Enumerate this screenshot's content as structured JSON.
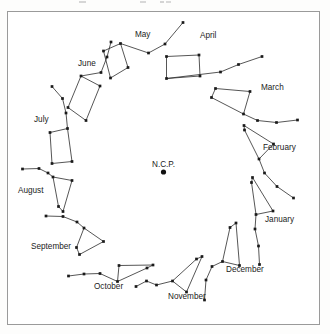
{
  "figure": {
    "pole_label": "N.C.P.",
    "pole_point": {
      "x": 163.5,
      "y": 172.0
    },
    "frame": {
      "x": 7,
      "y": 11,
      "width": 313,
      "height": 314,
      "border_color": "#9a9a9a"
    },
    "colors": {
      "star": "#1a1a1a",
      "line": "#2b2b2b",
      "text": "#1b1b1b",
      "background": "#ffffff"
    }
  },
  "chart_data": {
    "type": "scatter",
    "title": "",
    "xlabel": "",
    "ylabel": "",
    "grid": false,
    "legend": "none",
    "center": {
      "label": "N.C.P.",
      "x": 163.5,
      "y": 172.0
    },
    "xlim": [
      7,
      320
    ],
    "ylim": [
      11,
      325
    ],
    "series": [
      {
        "name": "May",
        "label": "May",
        "label_pos": {
          "x": 135,
          "y": 37
        },
        "points": [
          {
            "x": 103.5,
            "y": 51.0
          },
          {
            "x": 110.5,
            "y": 78.0
          },
          {
            "x": 128.0,
            "y": 67.5
          },
          {
            "x": 120.5,
            "y": 43.5
          },
          {
            "x": 148.5,
            "y": 53.0
          },
          {
            "x": 165.0,
            "y": 44.0
          },
          {
            "x": 183.0,
            "y": 22.5
          }
        ],
        "bowl": [
          0,
          1,
          2,
          3
        ],
        "handle": [
          3,
          4,
          5,
          6
        ]
      },
      {
        "name": "April",
        "label": "April",
        "label_pos": {
          "x": 200,
          "y": 38
        },
        "points": [
          {
            "x": 166.5,
            "y": 56.5
          },
          {
            "x": 166.5,
            "y": 78.5
          },
          {
            "x": 200.0,
            "y": 76.0
          },
          {
            "x": 199.0,
            "y": 55.0
          },
          {
            "x": 220.5,
            "y": 72.0
          },
          {
            "x": 238.5,
            "y": 64.5
          },
          {
            "x": 262.0,
            "y": 56.5
          }
        ],
        "bowl": [
          0,
          1,
          2,
          3
        ],
        "handle": [
          1,
          4,
          5,
          6
        ]
      },
      {
        "name": "March",
        "label": "March",
        "label_pos": {
          "x": 261,
          "y": 90
        },
        "points": [
          {
            "x": 215.5,
            "y": 88.5
          },
          {
            "x": 211.5,
            "y": 97.5
          },
          {
            "x": 243.5,
            "y": 114.0
          },
          {
            "x": 250.0,
            "y": 91.5
          },
          {
            "x": 257.5,
            "y": 120.5
          },
          {
            "x": 276.5,
            "y": 122.5
          },
          {
            "x": 297.5,
            "y": 120.0
          }
        ],
        "bowl": [
          0,
          1,
          2,
          3
        ],
        "handle": [
          2,
          4,
          5,
          6
        ]
      },
      {
        "name": "February",
        "label": "February",
        "label_pos": {
          "x": 263,
          "y": 150
        },
        "points": [
          {
            "x": 244.0,
            "y": 125.5
          },
          {
            "x": 244.5,
            "y": 130.0
          },
          {
            "x": 259.0,
            "y": 159.0
          },
          {
            "x": 273.5,
            "y": 144.0
          },
          {
            "x": 264.5,
            "y": 173.0
          },
          {
            "x": 277.0,
            "y": 186.5
          },
          {
            "x": 293.5,
            "y": 198.0
          }
        ],
        "bowl": [
          0,
          1,
          2,
          3
        ],
        "handle": [
          2,
          4,
          5,
          6
        ]
      },
      {
        "name": "January",
        "label": "January",
        "label_pos": {
          "x": 265,
          "y": 222
        },
        "points": [
          {
            "x": 252.5,
            "y": 177.5
          },
          {
            "x": 251.5,
            "y": 182.5
          },
          {
            "x": 256.0,
            "y": 214.5
          },
          {
            "x": 273.0,
            "y": 211.0
          },
          {
            "x": 255.0,
            "y": 229.0
          },
          {
            "x": 258.5,
            "y": 246.0
          },
          {
            "x": 259.5,
            "y": 264.5
          }
        ],
        "bowl": [
          0,
          1,
          2,
          3
        ],
        "handle": [
          2,
          4,
          5,
          6
        ]
      },
      {
        "name": "December",
        "label": "December",
        "label_pos": {
          "x": 226,
          "y": 272
        },
        "points": [
          {
            "x": 236.0,
            "y": 223.0
          },
          {
            "x": 230.0,
            "y": 227.5
          },
          {
            "x": 222.5,
            "y": 261.5
          },
          {
            "x": 239.5,
            "y": 265.5
          },
          {
            "x": 212.0,
            "y": 266.5
          },
          {
            "x": 206.0,
            "y": 280.0
          },
          {
            "x": 204.5,
            "y": 300.0
          }
        ],
        "bowl": [
          0,
          1,
          2,
          3
        ],
        "handle": [
          2,
          4,
          5,
          6
        ]
      },
      {
        "name": "November",
        "label": "November",
        "label_pos": {
          "x": 168,
          "y": 299
        },
        "points": [
          {
            "x": 202.0,
            "y": 256.5
          },
          {
            "x": 196.5,
            "y": 259.0
          },
          {
            "x": 172.5,
            "y": 281.0
          },
          {
            "x": 186.5,
            "y": 292.0
          },
          {
            "x": 156.5,
            "y": 285.0
          },
          {
            "x": 146.5,
            "y": 281.0
          },
          {
            "x": 136.0,
            "y": 286.5
          }
        ],
        "bowl": [
          0,
          1,
          2,
          3
        ],
        "handle": [
          2,
          4,
          5,
          6
        ]
      },
      {
        "name": "October",
        "label": "October",
        "label_pos": {
          "x": 94,
          "y": 289
        },
        "points": [
          {
            "x": 153.0,
            "y": 265.0
          },
          {
            "x": 147.0,
            "y": 268.0
          },
          {
            "x": 117.5,
            "y": 281.5
          },
          {
            "x": 119.0,
            "y": 265.5
          },
          {
            "x": 100.0,
            "y": 273.5
          },
          {
            "x": 84.0,
            "y": 274.0
          },
          {
            "x": 68.5,
            "y": 276.0
          }
        ],
        "bowl": [
          0,
          1,
          2,
          3
        ],
        "handle": [
          2,
          4,
          5,
          6
        ]
      },
      {
        "name": "September",
        "label": "September",
        "label_pos": {
          "x": 31,
          "y": 249
        },
        "points": [
          {
            "x": 79.5,
            "y": 254.5
          },
          {
            "x": 76.5,
            "y": 247.5
          },
          {
            "x": 84.0,
            "y": 228.0
          },
          {
            "x": 103.5,
            "y": 241.5
          },
          {
            "x": 77.0,
            "y": 222.0
          },
          {
            "x": 63.0,
            "y": 216.5
          },
          {
            "x": 46.0,
            "y": 216.0
          }
        ],
        "bowl": [
          0,
          1,
          2,
          3
        ],
        "handle": [
          2,
          4,
          5,
          6
        ]
      },
      {
        "name": "August",
        "label": "August",
        "label_pos": {
          "x": 18,
          "y": 193
        },
        "points": [
          {
            "x": 63.0,
            "y": 211.5
          },
          {
            "x": 58.5,
            "y": 206.5
          },
          {
            "x": 53.0,
            "y": 177.0
          },
          {
            "x": 72.0,
            "y": 180.5
          },
          {
            "x": 48.0,
            "y": 173.0
          },
          {
            "x": 39.0,
            "y": 168.5
          },
          {
            "x": 22.5,
            "y": 169.0
          }
        ],
        "bowl": [
          0,
          1,
          2,
          3
        ],
        "handle": [
          2,
          4,
          5,
          6
        ]
      },
      {
        "name": "July",
        "label": "July",
        "label_pos": {
          "x": 34,
          "y": 122
        },
        "points": [
          {
            "x": 52.0,
            "y": 163.5
          },
          {
            "x": 72.0,
            "y": 161.5
          },
          {
            "x": 67.5,
            "y": 128.5
          },
          {
            "x": 50.0,
            "y": 132.5
          },
          {
            "x": 66.0,
            "y": 113.0
          },
          {
            "x": 62.5,
            "y": 98.5
          },
          {
            "x": 52.0,
            "y": 86.5
          }
        ],
        "bowl": [
          0,
          1,
          2,
          3
        ],
        "handle": [
          2,
          4,
          5,
          6
        ]
      },
      {
        "name": "June",
        "label": "June",
        "label_pos": {
          "x": 78,
          "y": 66
        },
        "points": [
          {
            "x": 68.0,
            "y": 107.5
          },
          {
            "x": 86.0,
            "y": 120.5
          },
          {
            "x": 100.0,
            "y": 86.0
          },
          {
            "x": 81.0,
            "y": 76.0
          },
          {
            "x": 101.0,
            "y": 72.5
          },
          {
            "x": 107.0,
            "y": 57.0
          },
          {
            "x": 111.0,
            "y": 42.0
          }
        ],
        "bowl": [
          0,
          1,
          2,
          3
        ],
        "handle": [
          3,
          4,
          5,
          6
        ]
      }
    ]
  }
}
